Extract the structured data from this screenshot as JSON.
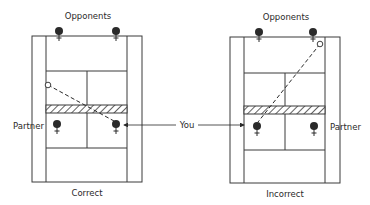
{
  "colors": {
    "ink": "#2a2a2a",
    "paper": "#ffffff",
    "line": "#3a3a3a"
  },
  "center_label": {
    "text": "You",
    "x": 187,
    "y": 128,
    "arrow_left": {
      "x1": 176,
      "x2": 124,
      "y": 125
    },
    "arrow_right": {
      "x1": 198,
      "x2": 244,
      "y": 125
    }
  },
  "courts": [
    {
      "id": "correct",
      "caption": "Correct",
      "caption_pos": {
        "x": 87,
        "y": 196
      },
      "top_label": "Opponents",
      "top_label_pos": {
        "x": 88,
        "y": 19
      },
      "side_label": "Partner",
      "side_label_pos": {
        "x": 13,
        "y": 129,
        "anchor": "start"
      },
      "outer": {
        "x": 32,
        "y": 36,
        "w": 110,
        "h": 146
      },
      "alley_left_x": 46,
      "alley_right_x": 127,
      "service_top_y": 71,
      "service_bottom_y": 148,
      "center_x": 87,
      "net": {
        "y": 105,
        "h": 8
      },
      "opponents": [
        {
          "x": 59,
          "y": 31
        },
        {
          "x": 116,
          "y": 31
        }
      ],
      "near_players": [
        {
          "role": "partner",
          "x": 57,
          "y": 124
        },
        {
          "role": "you",
          "x": 116,
          "y": 124
        }
      ],
      "ball_path": {
        "x1": 48,
        "y1": 85,
        "x2": 114,
        "y2": 121
      }
    },
    {
      "id": "incorrect",
      "caption": "Incorrect",
      "caption_pos": {
        "x": 285,
        "y": 197
      },
      "top_label": "Opponents",
      "top_label_pos": {
        "x": 286,
        "y": 20
      },
      "side_label": "Partner",
      "side_label_pos": {
        "x": 330,
        "y": 130,
        "anchor": "start"
      },
      "outer": {
        "x": 230,
        "y": 37,
        "w": 110,
        "h": 146
      },
      "alley_left_x": 244,
      "alley_right_x": 325,
      "service_top_y": 73,
      "service_bottom_y": 150,
      "center_x": 285,
      "net": {
        "y": 106,
        "h": 8
      },
      "opponents": [
        {
          "x": 259,
          "y": 32
        },
        {
          "x": 313,
          "y": 32
        }
      ],
      "near_players": [
        {
          "role": "you",
          "x": 257,
          "y": 126
        },
        {
          "role": "partner",
          "x": 314,
          "y": 126
        }
      ],
      "ball_path": {
        "x1": 320,
        "y1": 44,
        "x2": 258,
        "y2": 122
      }
    }
  ]
}
